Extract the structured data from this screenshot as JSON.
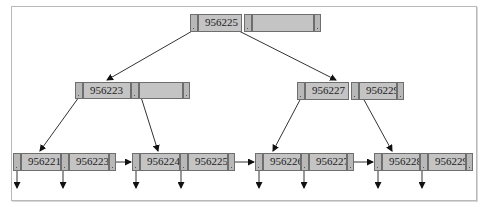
{
  "diagram": {
    "type": "B+ tree",
    "colors": {
      "node_fill": "#c4c4c4",
      "pointer_fill": "#b8b8b8",
      "border": "#6e6e6e",
      "line": "#333333",
      "frame": "#b9b9b9"
    },
    "root": {
      "keys": [
        "956225",
        ""
      ]
    },
    "internal": [
      {
        "id": "left",
        "keys": [
          "956223",
          ""
        ]
      },
      {
        "id": "right",
        "keys": [
          "956227",
          "956229"
        ]
      }
    ],
    "leaves": [
      {
        "keys": [
          "956221",
          "956223"
        ]
      },
      {
        "keys": [
          "956224",
          "956225"
        ]
      },
      {
        "keys": [
          "956226",
          "956227"
        ]
      },
      {
        "keys": [
          "956228",
          "956229"
        ]
      }
    ]
  }
}
